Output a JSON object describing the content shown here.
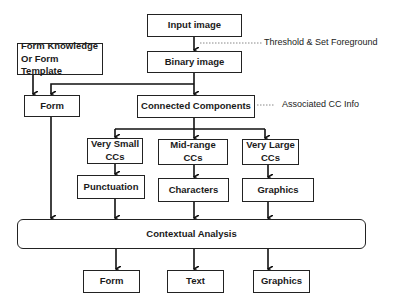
{
  "diagram": {
    "nodes": {
      "input_image": "Input image",
      "binary_image": "Binary image",
      "form_knowledge": "Form Knowledge\nOr Form Template",
      "form": "Form",
      "connected_components": "Connected Components",
      "very_small_ccs": "Very Small\nCCs",
      "mid_range_ccs": "Mid-range\nCCs",
      "very_large_ccs": "Very Large\nCCs",
      "punctuation": "Punctuation",
      "characters": "Characters",
      "graphics_mid": "Graphics",
      "contextual_analysis": "Contextual Analysis",
      "out_form": "Form",
      "out_text": "Text",
      "out_graphics": "Graphics"
    },
    "annotations": {
      "threshold": "Threshold & Set Foreground",
      "associated_cc": "Associated CC Info"
    },
    "edges": [
      [
        "Input image",
        "Binary image"
      ],
      [
        "Binary image",
        "Connected Components"
      ],
      [
        "Binary image",
        "Form"
      ],
      [
        "Form Knowledge Or Form Template",
        "Form"
      ],
      [
        "Connected Components",
        "Very Small CCs"
      ],
      [
        "Connected Components",
        "Mid-range CCs"
      ],
      [
        "Connected Components",
        "Very Large CCs"
      ],
      [
        "Very Small CCs",
        "Punctuation"
      ],
      [
        "Mid-range CCs",
        "Characters"
      ],
      [
        "Very Large CCs",
        "Graphics"
      ],
      [
        "Form",
        "Contextual Analysis"
      ],
      [
        "Punctuation",
        "Contextual Analysis"
      ],
      [
        "Characters",
        "Contextual Analysis"
      ],
      [
        "Graphics",
        "Contextual Analysis"
      ],
      [
        "Contextual Analysis",
        "Form"
      ],
      [
        "Contextual Analysis",
        "Text"
      ],
      [
        "Contextual Analysis",
        "Graphics"
      ]
    ]
  }
}
